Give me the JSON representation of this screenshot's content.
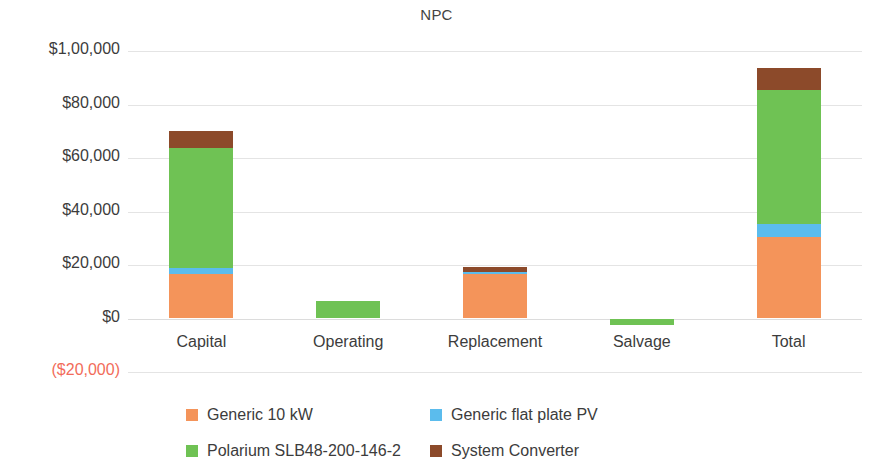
{
  "chart_data": {
    "type": "bar",
    "subtype": "stacked-bar",
    "title": "NPC",
    "xlabel": "",
    "ylabel": "",
    "categories": [
      "Capital",
      "Operating",
      "Replacement",
      "Salvage",
      "Total"
    ],
    "series": [
      {
        "name": "Generic 10 kW",
        "color": "#f4945a",
        "values": [
          16800,
          0,
          16500,
          0,
          30500
        ]
      },
      {
        "name": "Generic flat plate PV",
        "color": "#5bbced",
        "values": [
          2000,
          0,
          900,
          0,
          5000
        ]
      },
      {
        "name": "Polarium SLB48-200-146-2",
        "color": "#6fc254",
        "values": [
          45000,
          6500,
          0,
          -2500,
          50000
        ]
      },
      {
        "name": "System Converter",
        "color": "#8c4a2a",
        "values": [
          6400,
          0,
          1800,
          0,
          8300
        ]
      }
    ],
    "totals": [
      70200,
      6500,
      19200,
      -2500,
      93800
    ],
    "ylim": [
      -20000,
      100000
    ],
    "yticks": [
      100000,
      80000,
      60000,
      40000,
      20000,
      0,
      -20000
    ],
    "ytick_labels": [
      "$1,00,000",
      "$80,000",
      "$60,000",
      "$40,000",
      "$20,000",
      "$0",
      "($20,000)"
    ],
    "negative_tick_color": "#f26c5a",
    "grid": true,
    "legend_position": "bottom"
  },
  "legend": {
    "items": [
      {
        "label": "Generic 10 kW",
        "color": "#f4945a"
      },
      {
        "label": "Generic flat plate PV",
        "color": "#5bbced"
      },
      {
        "label": "Polarium SLB48-200-146-2",
        "color": "#6fc254"
      },
      {
        "label": "System Converter",
        "color": "#8c4a2a"
      }
    ]
  }
}
